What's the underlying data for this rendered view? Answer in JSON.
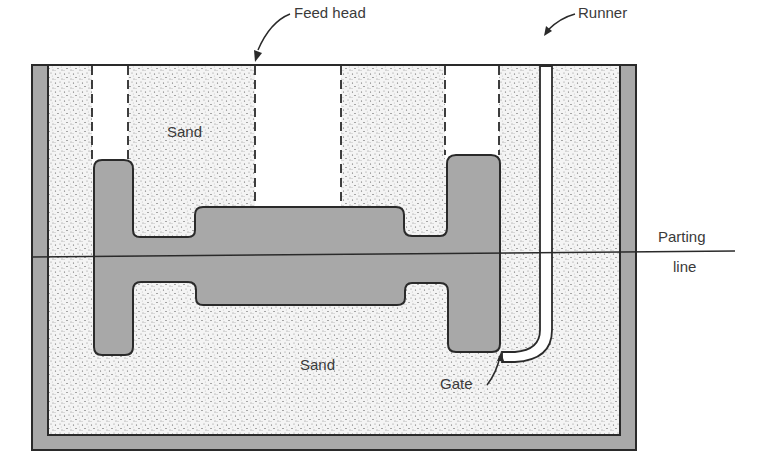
{
  "diagram": {
    "labels": {
      "feed_head": "Feed head",
      "runner": "Runner",
      "sand_top": "Sand",
      "sand_bottom": "Sand",
      "parting_line_1": "Parting",
      "parting_line_2": "line",
      "gate": "Gate"
    },
    "colors": {
      "flask": "#a9a9a9",
      "casting": "#a8a8a8",
      "sand": "#f2f2f2",
      "outline": "#2a2a2a"
    }
  }
}
